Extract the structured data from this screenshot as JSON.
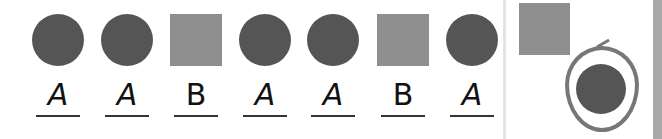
{
  "sequence": [
    {
      "shape": "circle",
      "label": "A"
    },
    {
      "shape": "circle",
      "label": "A"
    },
    {
      "shape": "square",
      "label": "B"
    },
    {
      "shape": "circle",
      "label": "A"
    },
    {
      "shape": "circle",
      "label": "A"
    },
    {
      "shape": "square",
      "label": "B"
    },
    {
      "shape": "circle",
      "label": "A"
    }
  ],
  "options": [
    {
      "shape": "square",
      "selected": false
    },
    {
      "shape": "circle",
      "selected": true
    }
  ],
  "colors": {
    "circle": "#555555",
    "square": "#8f8f8f",
    "selection_loop": "#777777"
  }
}
